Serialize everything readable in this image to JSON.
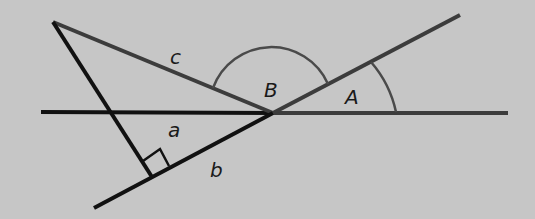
{
  "diagram": {
    "type": "geometry-figure",
    "background": "#c6c6c6",
    "colors": {
      "black_line": "#111111",
      "grey_line": "#3c3c3c",
      "arc": "#4a4a4a"
    },
    "labels": {
      "c": "c",
      "a": "a",
      "b": "b",
      "B": "B",
      "A": "A"
    },
    "points": {
      "vertex": [
        273,
        113
      ],
      "top_left": [
        53,
        22
      ],
      "foot": [
        152,
        177
      ],
      "bottom_left_end": [
        94,
        208
      ],
      "upper_right_end": [
        460,
        15
      ],
      "horizontal_left_end": [
        41,
        112
      ],
      "horizontal_right_end": [
        508,
        113
      ]
    },
    "angles": [
      {
        "name": "B",
        "description": "obtuse angle between side c and upper ray"
      },
      {
        "name": "A",
        "description": "angle between horizontal and upper ray"
      }
    ],
    "right_angle_marker": "at foot of perpendicular on line b"
  }
}
